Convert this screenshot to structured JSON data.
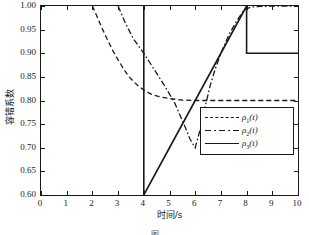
{
  "chart_data": {
    "type": "line",
    "title": "",
    "xlabel": "时间/s",
    "ylabel": "容错系数",
    "xlim": [
      0,
      10
    ],
    "ylim": [
      0.6,
      1.0
    ],
    "xticks": [
      "0",
      "1",
      "2",
      "3",
      "4",
      "5",
      "6",
      "7",
      "8",
      "9",
      "10"
    ],
    "yticks": [
      "0.60",
      "0.65",
      "0.70",
      "0.75",
      "0.80",
      "0.85",
      "0.90",
      "0.95",
      "1.00"
    ],
    "grid": false,
    "legend_position": "center-right",
    "legend": [
      "ρ₁(t)",
      "ρ₂(t)",
      "ρ₃(t)"
    ],
    "series": [
      {
        "name": "ρ₁(t)",
        "label_base": "ρ",
        "label_sub": "1",
        "label_arg": "(t)",
        "style": "dashed",
        "color": "#1a1a1a",
        "x": [
          2.0,
          2.2,
          2.4,
          2.6,
          2.8,
          3.0,
          3.2,
          3.4,
          3.6,
          3.8,
          4.0,
          4.3,
          4.6,
          5.0,
          5.5,
          6.0,
          7.0,
          8.0,
          9.0,
          10.0
        ],
        "y": [
          1.0,
          0.975,
          0.95,
          0.927,
          0.905,
          0.886,
          0.868,
          0.852,
          0.84,
          0.83,
          0.822,
          0.813,
          0.808,
          0.804,
          0.801,
          0.8,
          0.8,
          0.8,
          0.8,
          0.8
        ]
      },
      {
        "name": "ρ₂(t)",
        "label_base": "ρ",
        "label_sub": "2",
        "label_arg": "(t)",
        "style": "dashdot",
        "color": "#1a1a1a",
        "x": [
          3.0,
          3.3,
          3.6,
          4.0,
          4.4,
          4.8,
          5.2,
          5.6,
          5.8,
          6.0,
          6.2,
          6.4,
          6.6,
          6.8,
          7.0,
          7.3,
          7.6,
          7.9,
          8.2,
          8.6,
          9.0,
          9.5,
          10.0
        ],
        "y": [
          1.0,
          0.962,
          0.93,
          0.9,
          0.866,
          0.832,
          0.795,
          0.745,
          0.718,
          0.7,
          0.74,
          0.79,
          0.835,
          0.87,
          0.9,
          0.938,
          0.967,
          0.992,
          0.998,
          0.999,
          1.0,
          1.0,
          1.0
        ]
      },
      {
        "name": "ρ₃(t)",
        "label_base": "ρ",
        "label_sub": "3",
        "label_arg": "(t)",
        "style": "solid",
        "color": "#1a1a1a",
        "x": [
          4.0,
          4.0,
          5.0,
          6.0,
          7.0,
          8.0,
          8.0,
          9.0,
          10.0
        ],
        "y": [
          1.0,
          0.6,
          0.7,
          0.8,
          0.9,
          1.0,
          0.9,
          0.9,
          0.9
        ]
      }
    ]
  },
  "caption": {
    "text": "图"
  }
}
